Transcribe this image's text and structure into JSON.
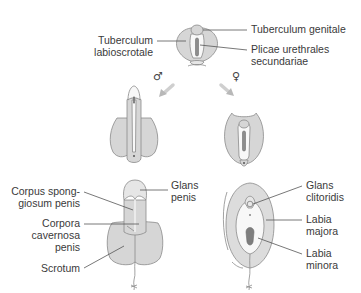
{
  "figure": {
    "stage_indifferent": {
      "labels": {
        "tuberculum_genitale": "Tuberculum genitale",
        "tuberculum_labioscrotale_1": "Tuberculum",
        "tuberculum_labioscrotale_2": "labioscrotale",
        "plicae_1": "Plicae urethrales",
        "plicae_2": "secundariae"
      }
    },
    "sex_symbols": {
      "male": "♂",
      "female": "♀"
    },
    "male_final": {
      "labels": {
        "corpus_spongiosum_1": "Corpus spong-",
        "corpus_spongiosum_2": "giosum penis",
        "corpora_cavernosa_1": "Corpora",
        "corpora_cavernosa_2": "cavernosa",
        "corpora_cavernosa_3": "penis",
        "scrotum": "Scrotum",
        "glans_penis_1": "Glans",
        "glans_penis_2": "penis"
      }
    },
    "female_final": {
      "labels": {
        "glans_clitoridis_1": "Glans",
        "glans_clitoridis_2": "clitoridis",
        "labia_majora_1": "Labia",
        "labia_majora_2": "majora",
        "labia_minora_1": "Labia",
        "labia_minora_2": "minora"
      }
    },
    "colors": {
      "skin": "#d6d6d6",
      "outline": "#8a8a8a",
      "text": "#3a3a3a",
      "arrow": "#cfcfcf"
    }
  }
}
